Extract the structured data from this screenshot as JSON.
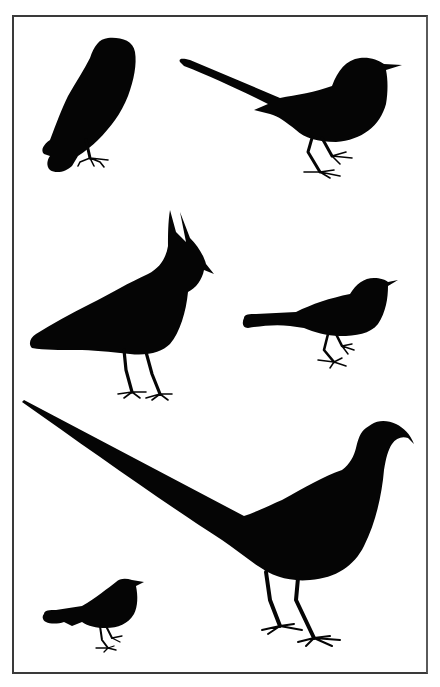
{
  "illustration": {
    "style": "black silhouettes on white",
    "colors": {
      "background": "#ffffff",
      "silhouette": "#050505",
      "border": "#3a3a3a"
    },
    "birds": [
      {
        "id": "owl",
        "label": "Owl",
        "position": "top-left"
      },
      {
        "id": "magpie",
        "label": "Magpie",
        "position": "top-right"
      },
      {
        "id": "lapwing",
        "label": "Lapwing",
        "position": "middle-left"
      },
      {
        "id": "blackbird",
        "label": "Blackbird",
        "position": "middle-right"
      },
      {
        "id": "pheasant",
        "label": "Pheasant",
        "position": "bottom-center"
      },
      {
        "id": "robin",
        "label": "Robin",
        "position": "bottom-left"
      }
    ]
  }
}
